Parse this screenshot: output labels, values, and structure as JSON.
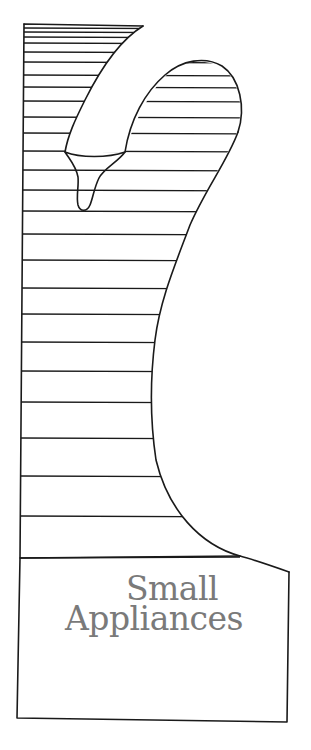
{
  "illustration": {
    "subject": "iron-with-hatched-background",
    "colors": {
      "line": "#1a1a1a",
      "title_text": "#7a7a7a",
      "background": "#ffffff"
    }
  },
  "title": {
    "line1": "Small",
    "line2": "Appliances"
  }
}
